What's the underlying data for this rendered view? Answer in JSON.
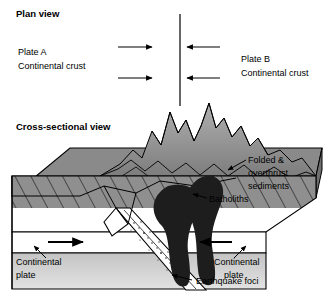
{
  "figure": {
    "background": "#ffffff",
    "line_color": "#000000"
  },
  "plan_view": {
    "title": "Plan view",
    "left_plate": {
      "name": "Plate A",
      "crust": "Continental crust"
    },
    "right_plate": {
      "name": "Plate B",
      "crust": "Continental crust"
    },
    "boundary_line": "plate-boundary",
    "arrows": [
      {
        "direction": "right",
        "row": 1
      },
      {
        "direction": "left",
        "row": 1
      },
      {
        "direction": "right",
        "row": 2
      },
      {
        "direction": "left",
        "row": 2
      }
    ]
  },
  "cross_section": {
    "title": "Cross-sectional view",
    "labels": {
      "folded": "Folded &",
      "overthrust": "overthrust",
      "sediments": "sediments",
      "batholiths": "Batholiths",
      "continental_plate_left_1": "Continental",
      "continental_plate_left_2": "plate",
      "continental_plate_right_1": "Continental",
      "continental_plate_right_2": "plate",
      "earthquake_foci": "Earthquake foci"
    },
    "arrows": [
      {
        "direction": "right",
        "side": "left-plate"
      },
      {
        "direction": "left",
        "side": "right-plate"
      }
    ],
    "colors": {
      "top_surface": "#8a8a8a",
      "front_face_upper": "#9a9a9a",
      "front_face_lower": "#cfcfcf",
      "hatch_band": "#8f8f8f",
      "mantle_gap": "#ffffff",
      "batholith": "#1d1d1d",
      "mountain_light": "#9e9e9e",
      "mountain_dark": "#6e6e6e",
      "slab": "#ffffff"
    }
  }
}
